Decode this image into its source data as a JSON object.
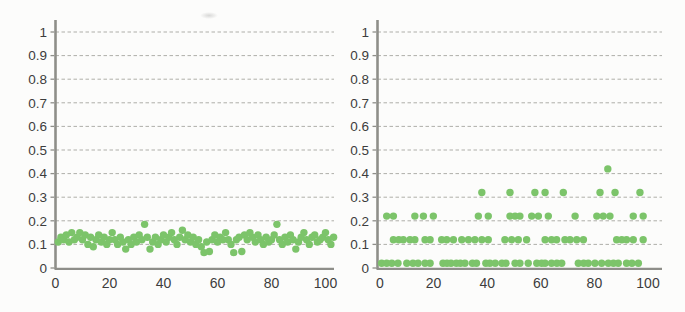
{
  "figure": {
    "colors": {
      "marker": "#7cc46a",
      "grid": "#a2a29c",
      "axis": "#8e8e89",
      "label": "#3d3d3d",
      "background": "#fcfcfb"
    }
  },
  "chart_data": [
    {
      "type": "scatter",
      "title": "",
      "xlabel": "",
      "ylabel": "",
      "xlim": [
        0,
        105
      ],
      "ylim": [
        0,
        1
      ],
      "xticks": [
        0,
        20,
        40,
        60,
        80,
        100
      ],
      "yticks": [
        0,
        0.1,
        0.2,
        0.3,
        0.4,
        0.5,
        0.6,
        0.7,
        0.8,
        0.9,
        1
      ],
      "grid": "horizontal-dashed",
      "legend": "none",
      "marker": {
        "shape": "circle",
        "color": "#7cc46a",
        "size": 7
      },
      "points": [
        [
          1,
          0.11
        ],
        [
          2,
          0.13
        ],
        [
          3,
          0.12
        ],
        [
          4,
          0.14
        ],
        [
          5,
          0.11
        ],
        [
          6,
          0.15
        ],
        [
          7,
          0.12
        ],
        [
          8,
          0.13
        ],
        [
          9,
          0.15
        ],
        [
          10,
          0.12
        ],
        [
          11,
          0.14
        ],
        [
          12,
          0.1
        ],
        [
          13,
          0.13
        ],
        [
          14,
          0.09
        ],
        [
          15,
          0.12
        ],
        [
          16,
          0.14
        ],
        [
          17,
          0.11
        ],
        [
          18,
          0.13
        ],
        [
          19,
          0.1
        ],
        [
          20,
          0.12
        ],
        [
          21,
          0.15
        ],
        [
          22,
          0.12
        ],
        [
          23,
          0.1
        ],
        [
          24,
          0.13
        ],
        [
          25,
          0.11
        ],
        [
          26,
          0.08
        ],
        [
          27,
          0.12
        ],
        [
          28,
          0.1
        ],
        [
          29,
          0.13
        ],
        [
          30,
          0.11
        ],
        [
          31,
          0.14
        ],
        [
          32,
          0.12
        ],
        [
          33,
          0.185
        ],
        [
          34,
          0.13
        ],
        [
          35,
          0.08
        ],
        [
          36,
          0.11
        ],
        [
          37,
          0.13
        ],
        [
          38,
          0.1
        ],
        [
          39,
          0.12
        ],
        [
          40,
          0.14
        ],
        [
          41,
          0.11
        ],
        [
          42,
          0.13
        ],
        [
          43,
          0.15
        ],
        [
          44,
          0.12
        ],
        [
          45,
          0.1
        ],
        [
          46,
          0.13
        ],
        [
          47,
          0.16
        ],
        [
          48,
          0.12
        ],
        [
          49,
          0.14
        ],
        [
          50,
          0.11
        ],
        [
          51,
          0.13
        ],
        [
          52,
          0.1
        ],
        [
          53,
          0.12
        ],
        [
          54,
          0.09
        ],
        [
          55,
          0.065
        ],
        [
          56,
          0.11
        ],
        [
          57,
          0.07
        ],
        [
          58,
          0.12
        ],
        [
          59,
          0.14
        ],
        [
          60,
          0.11
        ],
        [
          61,
          0.13
        ],
        [
          62,
          0.12
        ],
        [
          63,
          0.15
        ],
        [
          64,
          0.12
        ],
        [
          65,
          0.1
        ],
        [
          66,
          0.065
        ],
        [
          67,
          0.12
        ],
        [
          68,
          0.13
        ],
        [
          69,
          0.07
        ],
        [
          70,
          0.14
        ],
        [
          71,
          0.12
        ],
        [
          72,
          0.15
        ],
        [
          73,
          0.13
        ],
        [
          74,
          0.11
        ],
        [
          75,
          0.14
        ],
        [
          76,
          0.12
        ],
        [
          77,
          0.1
        ],
        [
          78,
          0.13
        ],
        [
          79,
          0.11
        ],
        [
          80,
          0.12
        ],
        [
          81,
          0.14
        ],
        [
          82,
          0.185
        ],
        [
          83,
          0.12
        ],
        [
          84,
          0.1
        ],
        [
          85,
          0.13
        ],
        [
          86,
          0.11
        ],
        [
          87,
          0.14
        ],
        [
          88,
          0.12
        ],
        [
          89,
          0.08
        ],
        [
          90,
          0.11
        ],
        [
          91,
          0.13
        ],
        [
          92,
          0.15
        ],
        [
          93,
          0.12
        ],
        [
          94,
          0.1
        ],
        [
          95,
          0.13
        ],
        [
          96,
          0.14
        ],
        [
          97,
          0.11
        ],
        [
          98,
          0.12
        ],
        [
          99,
          0.13
        ],
        [
          100,
          0.15
        ],
        [
          101,
          0.12
        ],
        [
          102,
          0.1
        ],
        [
          103,
          0.13
        ]
      ]
    },
    {
      "type": "scatter",
      "title": "",
      "xlabel": "",
      "ylabel": "",
      "xlim": [
        0,
        105
      ],
      "ylim": [
        0,
        1
      ],
      "xticks": [
        0,
        20,
        40,
        60,
        80,
        100
      ],
      "yticks": [
        0,
        0.1,
        0.2,
        0.3,
        0.4,
        0.5,
        0.6,
        0.7,
        0.8,
        0.9,
        1
      ],
      "grid": "horizontal-dashed",
      "legend": "none",
      "marker": {
        "shape": "circle",
        "color": "#7cc46a",
        "size": 7
      },
      "points": [
        [
          0.6,
          0.02
        ],
        [
          2.5,
          0.02
        ],
        [
          4.4,
          0.02
        ],
        [
          6.7,
          0.02
        ],
        [
          10,
          0.02
        ],
        [
          12.3,
          0.02
        ],
        [
          14.2,
          0.02
        ],
        [
          16.8,
          0.02
        ],
        [
          18.7,
          0.02
        ],
        [
          23.5,
          0.02
        ],
        [
          25,
          0.02
        ],
        [
          26.5,
          0.02
        ],
        [
          28.5,
          0.02
        ],
        [
          30,
          0.02
        ],
        [
          31.7,
          0.02
        ],
        [
          34.5,
          0.02
        ],
        [
          36,
          0.02
        ],
        [
          39.5,
          0.02
        ],
        [
          41,
          0.02
        ],
        [
          43,
          0.02
        ],
        [
          45.5,
          0.02
        ],
        [
          47,
          0.02
        ],
        [
          50.4,
          0.02
        ],
        [
          52.2,
          0.02
        ],
        [
          55.3,
          0.02
        ],
        [
          58.5,
          0.02
        ],
        [
          60.3,
          0.02
        ],
        [
          61.6,
          0.02
        ],
        [
          64,
          0.02
        ],
        [
          66,
          0.02
        ],
        [
          67.8,
          0.02
        ],
        [
          74,
          0.02
        ],
        [
          76,
          0.02
        ],
        [
          77.7,
          0.02
        ],
        [
          80.2,
          0.02
        ],
        [
          82.7,
          0.02
        ],
        [
          85.2,
          0.02
        ],
        [
          87.1,
          0.02
        ],
        [
          88.9,
          0.02
        ],
        [
          92,
          0.02
        ],
        [
          94,
          0.02
        ],
        [
          96.4,
          0.02
        ],
        [
          5,
          0.12
        ],
        [
          7,
          0.12
        ],
        [
          8.7,
          0.12
        ],
        [
          11.2,
          0.12
        ],
        [
          13,
          0.12
        ],
        [
          16.8,
          0.12
        ],
        [
          18.7,
          0.12
        ],
        [
          23,
          0.12
        ],
        [
          24.9,
          0.12
        ],
        [
          27.4,
          0.12
        ],
        [
          30.5,
          0.12
        ],
        [
          33,
          0.12
        ],
        [
          35.4,
          0.12
        ],
        [
          38,
          0.12
        ],
        [
          40.4,
          0.12
        ],
        [
          46.6,
          0.12
        ],
        [
          49.1,
          0.12
        ],
        [
          51.6,
          0.12
        ],
        [
          54.7,
          0.12
        ],
        [
          61.6,
          0.12
        ],
        [
          64,
          0.12
        ],
        [
          65.9,
          0.12
        ],
        [
          69,
          0.12
        ],
        [
          70.9,
          0.12
        ],
        [
          73.4,
          0.12
        ],
        [
          75.9,
          0.12
        ],
        [
          88.3,
          0.12
        ],
        [
          90.2,
          0.12
        ],
        [
          92,
          0.12
        ],
        [
          94.5,
          0.12
        ],
        [
          98.2,
          0.12
        ],
        [
          2.5,
          0.22
        ],
        [
          5,
          0.22
        ],
        [
          13,
          0.22
        ],
        [
          16.2,
          0.22
        ],
        [
          19.9,
          0.22
        ],
        [
          36.7,
          0.22
        ],
        [
          40.4,
          0.22
        ],
        [
          48.5,
          0.22
        ],
        [
          50.4,
          0.22
        ],
        [
          52.2,
          0.22
        ],
        [
          56.6,
          0.22
        ],
        [
          59.1,
          0.22
        ],
        [
          62.8,
          0.22
        ],
        [
          72.8,
          0.22
        ],
        [
          80.9,
          0.22
        ],
        [
          83.3,
          0.22
        ],
        [
          85.8,
          0.22
        ],
        [
          94.5,
          0.22
        ],
        [
          98.2,
          0.22
        ],
        [
          38,
          0.32
        ],
        [
          48.5,
          0.32
        ],
        [
          57.8,
          0.32
        ],
        [
          61.6,
          0.32
        ],
        [
          68.4,
          0.32
        ],
        [
          82.1,
          0.32
        ],
        [
          87.7,
          0.32
        ],
        [
          97,
          0.32
        ],
        [
          85,
          0.42
        ]
      ]
    }
  ]
}
